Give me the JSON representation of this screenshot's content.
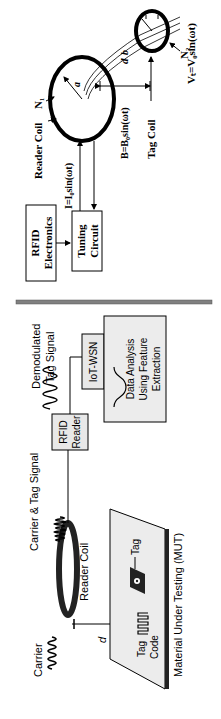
{
  "figure": {
    "orientation": "rotated -90deg (text reads bottom-to-top)",
    "left_panel": {
      "carrier_label": "Carrier",
      "reader_coil_label": "Reader Coil",
      "carrier_tag_signal_label": "Carrier & Tag Signal",
      "rfid_reader_line1": "RFID",
      "rfid_reader_line2": "Reader",
      "demod_line1": "Demodulated",
      "demod_line2": "Tag Signal",
      "iot_wsn_label": "IoT-WSN",
      "data_analysis_line1": "Data Analysis",
      "data_analysis_line2": "Using Feature",
      "data_analysis_line3": "Extraction",
      "distance_label": "d",
      "tag_label": "Tag",
      "tag_code_line1": "Tag",
      "tag_code_line2": "Code",
      "mut_label": "Material Under Testing (MUT)"
    },
    "right_panel": {
      "rfid_electronics_line1": "RFID",
      "rfid_electronics_line2": "Electronics",
      "tuning_line1": "Tuning",
      "tuning_line2": "Circuit",
      "current_eq": "I=I₀sin(ωt)",
      "reader_coil_label": "Reader Coil",
      "n1_label": "N₁",
      "radius_a": "a",
      "radius_b": "b",
      "field_eq": "B=B₀sin(ωt)",
      "tag_coil_label": "Tag Coil",
      "n2_label": "N₂",
      "distance_label": "d",
      "voltage_eq": "Vₜ=V₀sin(ωt)"
    },
    "divider_color": "#808080"
  }
}
